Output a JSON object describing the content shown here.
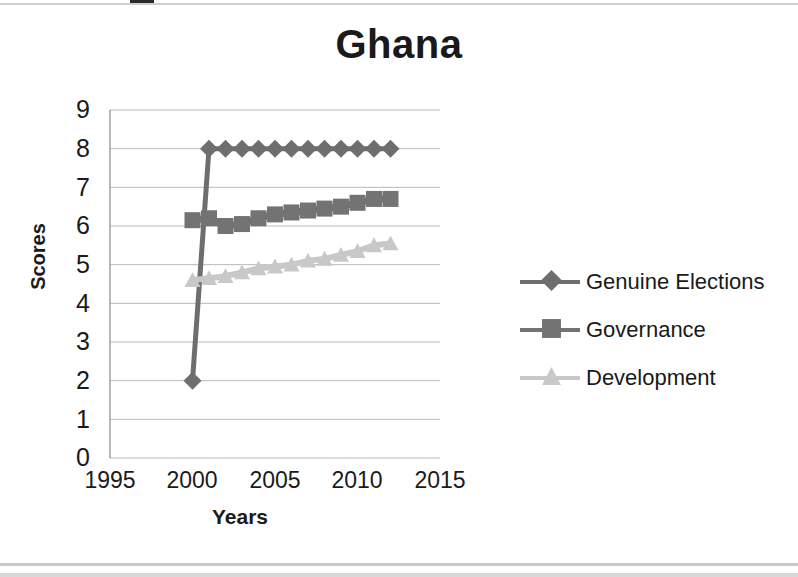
{
  "chart_data": {
    "type": "line",
    "title": "Ghana",
    "xlabel": "Years",
    "ylabel": "Scores",
    "xlim": [
      1995,
      2015
    ],
    "ylim": [
      0,
      9
    ],
    "xticks": [
      1995,
      2000,
      2005,
      2010,
      2015
    ],
    "yticks": [
      0,
      1,
      2,
      3,
      4,
      5,
      6,
      7,
      8,
      9
    ],
    "grid": true,
    "legend_position": "right",
    "x": [
      2000,
      2001,
      2002,
      2003,
      2004,
      2005,
      2006,
      2007,
      2008,
      2009,
      2010,
      2011,
      2012
    ],
    "series": [
      {
        "name": "Genuine Elections",
        "marker": "diamond",
        "color": "#6e6e6e",
        "values": [
          2.0,
          8.0,
          8.0,
          8.0,
          8.0,
          8.0,
          8.0,
          8.0,
          8.0,
          8.0,
          8.0,
          8.0,
          8.0
        ]
      },
      {
        "name": "Governance",
        "marker": "square",
        "color": "#737373",
        "values": [
          6.15,
          6.2,
          6.0,
          6.05,
          6.2,
          6.3,
          6.35,
          6.4,
          6.45,
          6.5,
          6.6,
          6.7,
          6.7
        ]
      },
      {
        "name": "Development",
        "marker": "triangle",
        "color": "#c8c8c8",
        "values": [
          4.6,
          4.65,
          4.7,
          4.8,
          4.9,
          4.95,
          5.0,
          5.1,
          5.15,
          5.25,
          5.35,
          5.5,
          5.55
        ]
      }
    ]
  },
  "chart": {
    "title": "Ghana",
    "axis": {
      "y_label": "Scores",
      "x_label": "Years",
      "y_ticks": [
        "9",
        "8",
        "7",
        "6",
        "5",
        "4",
        "3",
        "2",
        "1",
        "0"
      ],
      "x_ticks": [
        "1995",
        "2000",
        "2005",
        "2010",
        "2015"
      ]
    },
    "legend": {
      "items": [
        {
          "label": "Genuine Elections",
          "marker": "diamond",
          "color": "#6e6e6e"
        },
        {
          "label": "Governance",
          "marker": "square",
          "color": "#737373"
        },
        {
          "label": "Development",
          "marker": "triangle",
          "color": "#c8c8c8"
        }
      ]
    },
    "colors": {
      "genuine_elections": "#6e6e6e",
      "governance": "#737373",
      "development": "#c8c8c8",
      "gridline": "#b9b9b9",
      "axis": "#9a9a9a",
      "text": "#1a1a1a",
      "background": "#ffffff"
    }
  }
}
